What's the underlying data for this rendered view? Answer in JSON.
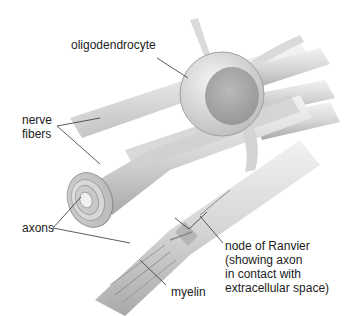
{
  "diagram": {
    "labels": {
      "oligodendrocyte": "oligodendrocyte",
      "nerve_fibers": "nerve\nfibers",
      "axons": "axons",
      "node_of_ranvier": "node of Ranvier\n(showing axon\nin contact with\nextracellular space)",
      "myelin": "myelin"
    },
    "colors": {
      "background": "#ffffff",
      "fiber_light": "#e8e8e8",
      "fiber_mid": "#c9c9c9",
      "fiber_dark": "#9a9a9a",
      "nucleus": "#a8a8a8",
      "leader_line": "#333333",
      "text": "#222222"
    }
  }
}
